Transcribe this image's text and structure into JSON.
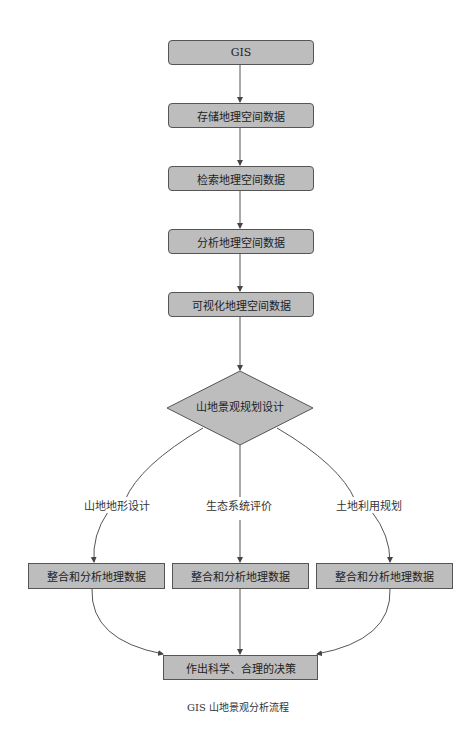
{
  "diagram": {
    "type": "flowchart",
    "colors": {
      "node_fill": "#bdbdbd",
      "node_border": "#555555",
      "edge": "#555555"
    },
    "nodes": {
      "gis": "GIS",
      "store": "存储地理空间数据",
      "retrieve": "检索地理空间数据",
      "analyze": "分析地理空间数据",
      "visualize": "可视化地理空间数据",
      "decision": "山地景观规划设计",
      "integrate_left": "整合和分析地理数据",
      "integrate_middle": "整合和分析地理数据",
      "integrate_right": "整合和分析地理数据",
      "final": "作出科学、合理的决策"
    },
    "edge_labels": {
      "left": "山地地形设计",
      "middle": "生态系统评价",
      "right": "土地利用规划"
    },
    "edges": [
      [
        "GIS",
        "存储地理空间数据"
      ],
      [
        "存储地理空间数据",
        "检索地理空间数据"
      ],
      [
        "检索地理空间数据",
        "分析地理空间数据"
      ],
      [
        "分析地理空间数据",
        "可视化地理空间数据"
      ],
      [
        "可视化地理空间数据",
        "山地景观规划设计"
      ],
      [
        "山地景观规划设计",
        "整合和分析地理数据 (左)",
        "山地地形设计"
      ],
      [
        "山地景观规划设计",
        "整合和分析地理数据 (中)",
        "生态系统评价"
      ],
      [
        "山地景观规划设计",
        "整合和分析地理数据 (右)",
        "土地利用规划"
      ],
      [
        "整合和分析地理数据 (左)",
        "作出科学、合理的决策"
      ],
      [
        "整合和分析地理数据 (中)",
        "作出科学、合理的决策"
      ],
      [
        "整合和分析地理数据 (右)",
        "作出科学、合理的决策"
      ]
    ],
    "caption": "GIS 山地景观分析流程"
  }
}
